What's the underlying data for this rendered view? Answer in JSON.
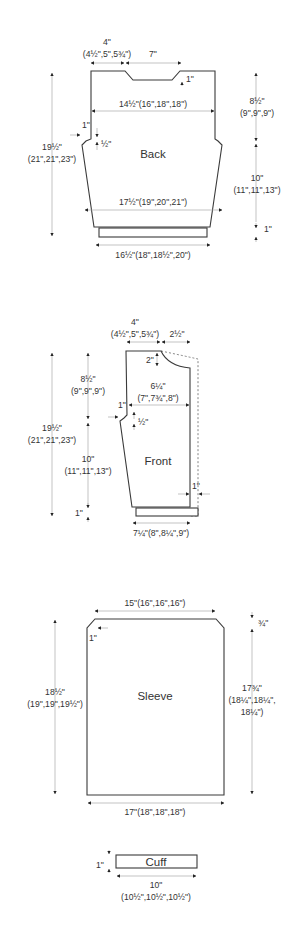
{
  "colors": {
    "outline": "#3a3a3a",
    "dimension_line": "#aaaaaa",
    "text": "#333333",
    "background": "#ffffff"
  },
  "pieces": {
    "back": {
      "name": "Back",
      "shoulder_width": "4\"",
      "shoulder_width_sizes": "(4½\",5\",5¾\")",
      "neck_width": "7\"",
      "neck_depth": "1\"",
      "upper_width": "14½\"(16\",18\",18\")",
      "armhole_depth": "8½\"",
      "armhole_depth_sizes": "(9\",9\",9\")",
      "armhole_inset": "1\"",
      "armhole_drop": "½\"",
      "total_length": "19½\"",
      "total_length_sizes": "(21\",21\",23\")",
      "side_length": "10\"",
      "side_length_sizes": "(11\",11\",13\")",
      "hip_width": "17½\"(19\",20\",21\")",
      "ribbing_height": "1\"",
      "ribbing_width": "16½\"(18\",18½\",20\")"
    },
    "front": {
      "name": "Front",
      "shoulder_width": "4\"",
      "shoulder_width_sizes": "(4½\",5\",5¾\")",
      "neck_width": "2½\"",
      "neck_depth": "2\"",
      "upper_width": "6¼\"",
      "upper_width_sizes": "(7\",7¾\",8\")",
      "armhole_depth": "8½\"",
      "armhole_depth_sizes": "(9\",9\",9\")",
      "armhole_inset": "1\"",
      "armhole_drop": "½\"",
      "total_length": "19½\"",
      "total_length_sizes": "(21\",21\",23\")",
      "side_length": "10\"",
      "side_length_sizes": "(11\",11\",13\")",
      "ribbing_height": "1\"",
      "placket_width": "1\"",
      "ribbing_width": "7¼\"(8\",8¼\",9\")"
    },
    "sleeve": {
      "name": "Sleeve",
      "top_width": "15\"(16\",16\",16\")",
      "corner_inset": "1\"",
      "cap_drop": "¾\"",
      "left_length": "18½\"",
      "left_length_sizes": "(19\",19\",19½\")",
      "right_length": "17¾\"",
      "right_length_sizes_1": "(18¼\",18¼\",",
      "right_length_sizes_2": "18¼\")",
      "bottom_width": "17\"(18\",18\",18\")"
    },
    "cuff": {
      "name": "Cuff",
      "height": "1\"",
      "width": "10\"",
      "width_sizes": "(10½\",10½\",10½\")"
    }
  }
}
